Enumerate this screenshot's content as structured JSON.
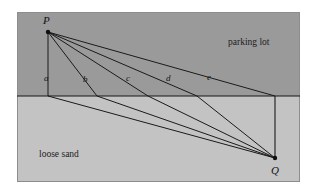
{
  "figure": {
    "canvas": {
      "width": 318,
      "height": 192,
      "background": "#ffffff"
    },
    "frame": {
      "x": 17,
      "y": 12,
      "width": 283,
      "height": 170,
      "border_color": "#8d8d8d"
    },
    "regions": [
      {
        "id": "parking-lot",
        "label": "parking lot",
        "fill": "#9a9a9a",
        "label_x": 228,
        "label_y": 45,
        "rect": {
          "x": 17,
          "y": 12,
          "width": 283,
          "height": 84
        }
      },
      {
        "id": "loose-sand",
        "label": "loose sand",
        "fill": "#c3c3c3",
        "label_x": 39,
        "label_y": 157,
        "rect": {
          "x": 17,
          "y": 96,
          "width": 283,
          "height": 86
        }
      }
    ],
    "boundary": {
      "name": "interface-line",
      "x1": 17,
      "y1": 96,
      "x2": 300,
      "y2": 96,
      "color": "#171717",
      "width": 1.1
    },
    "points": [
      {
        "id": "P",
        "label": "P",
        "x": 48,
        "y": 32,
        "label_x": 43,
        "label_y": 24,
        "dot_r": 2.2,
        "color": "#101010"
      },
      {
        "id": "Q",
        "label": "Q",
        "x": 275,
        "y": 158,
        "label_x": 271,
        "label_y": 174,
        "dot_r": 2.2,
        "color": "#101010"
      }
    ],
    "paths": [
      {
        "id": "a",
        "label": "a",
        "cross_x": 48,
        "label_x": 44,
        "label_y": 81
      },
      {
        "id": "b",
        "label": "b",
        "cross_x": 97,
        "label_x": 83,
        "label_y": 82
      },
      {
        "id": "c",
        "label": "c",
        "cross_x": 148,
        "label_x": 126,
        "label_y": 81
      },
      {
        "id": "d",
        "label": "d",
        "cross_x": 197,
        "label_x": 166,
        "label_y": 81
      },
      {
        "id": "e",
        "label": "e",
        "cross_x": 245,
        "label_x": 207,
        "label_y": 80
      }
    ],
    "path_style": {
      "color": "#1a1a1a",
      "width": 1.0
    },
    "vertical_drop": {
      "name": "q-vertical-line",
      "x": 275,
      "y1": 96,
      "y2": 158,
      "color": "#1a1a1a",
      "width": 1.1
    }
  }
}
